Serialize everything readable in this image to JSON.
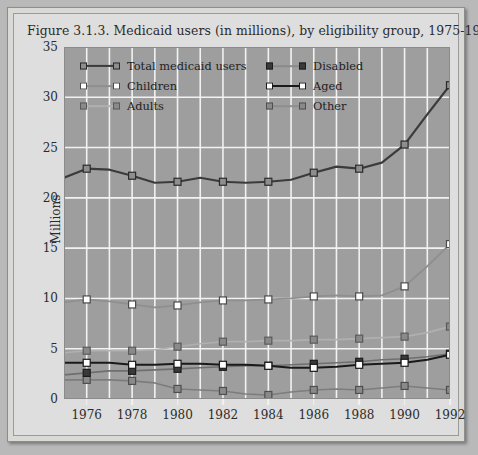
{
  "figure": {
    "title": "Figure 3.1.3. Medicaid users (in millions), by eligibility group, 1975-1992."
  },
  "chart_data": {
    "type": "line",
    "title": "Figure 3.1.3. Medicaid users (in millions), by eligibility group, 1975-1992.",
    "xlabel": "",
    "ylabel": "Millions",
    "ylim": [
      0,
      35
    ],
    "ytick_labels": [
      "0",
      "5",
      "10",
      "15",
      "20",
      "25",
      "30",
      "35"
    ],
    "yticks": [
      0,
      5,
      10,
      15,
      20,
      25,
      30,
      35
    ],
    "xlim": [
      1975,
      1992
    ],
    "x": [
      1975,
      1976,
      1977,
      1978,
      1979,
      1980,
      1981,
      1982,
      1983,
      1984,
      1985,
      1986,
      1987,
      1988,
      1989,
      1990,
      1991,
      1992
    ],
    "xtick_labels": [
      "1976",
      "1978",
      "1980",
      "1982",
      "1984",
      "1986",
      "1988",
      "1990",
      "1992"
    ],
    "xticks": [
      1976,
      1978,
      1980,
      1982,
      1984,
      1986,
      1988,
      1990,
      1992
    ],
    "grid": true,
    "legend_position": "upper-left-inside",
    "plot_bgcolor": "#9e9e9e",
    "grid_color": "#f2f2f2",
    "series": [
      {
        "name": "Total medicaid users",
        "color": "#3b3b3b",
        "marker_fill": "#8e8e8e",
        "marker_edge": "#2a2a2a",
        "line_width": 2.2,
        "values": [
          22.0,
          22.9,
          22.8,
          22.2,
          21.5,
          21.6,
          22.0,
          21.6,
          21.5,
          21.6,
          21.8,
          22.5,
          23.1,
          22.9,
          23.5,
          25.3,
          28.3,
          31.2
        ]
      },
      {
        "name": "Disabled",
        "color": "#6f6f6f",
        "marker_fill": "#3a3a3a",
        "marker_edge": "#1c1c1c",
        "line_width": 1.6,
        "values": [
          2.4,
          2.6,
          2.8,
          2.8,
          2.9,
          3.0,
          3.1,
          3.2,
          3.3,
          3.3,
          3.4,
          3.5,
          3.6,
          3.7,
          3.9,
          4.0,
          4.2,
          4.5
        ]
      },
      {
        "name": "Children",
        "color": "#8f8f8f",
        "marker_fill": "#ffffff",
        "marker_edge": "#4a4a4a",
        "line_width": 1.8,
        "values": [
          9.6,
          9.9,
          9.7,
          9.4,
          9.1,
          9.3,
          9.6,
          9.8,
          9.8,
          9.9,
          10.0,
          10.2,
          10.3,
          10.2,
          10.3,
          11.2,
          13.2,
          15.4
        ]
      },
      {
        "name": "Aged",
        "color": "#1a1a1a",
        "marker_fill": "#ffffff",
        "marker_edge": "#1a1a1a",
        "line_width": 2.0,
        "values": [
          3.6,
          3.6,
          3.6,
          3.4,
          3.4,
          3.5,
          3.5,
          3.4,
          3.4,
          3.3,
          3.1,
          3.1,
          3.2,
          3.4,
          3.5,
          3.6,
          3.9,
          4.4
        ]
      },
      {
        "name": "Adults",
        "color": "#b0b0b0",
        "marker_fill": "#8a8a8a",
        "marker_edge": "#5a5a5a",
        "line_width": 1.6,
        "values": [
          4.6,
          4.8,
          4.8,
          4.8,
          4.9,
          5.2,
          5.5,
          5.7,
          5.7,
          5.8,
          5.8,
          5.9,
          5.9,
          6.0,
          6.1,
          6.2,
          6.6,
          7.2
        ]
      },
      {
        "name": "Other",
        "color": "#7d7d7d",
        "marker_fill": "#8a8a8a",
        "marker_edge": "#4e4e4e",
        "line_width": 1.6,
        "values": [
          1.9,
          1.9,
          1.9,
          1.8,
          1.6,
          1.0,
          0.9,
          0.8,
          0.5,
          0.4,
          0.7,
          0.9,
          1.0,
          0.9,
          1.1,
          1.3,
          1.1,
          0.9
        ]
      }
    ]
  },
  "legend": {
    "rows": [
      [
        {
          "name": "Total medicaid users",
          "line": "#3b3b3b",
          "fill": "#8e8e8e",
          "edge": "#2a2a2a",
          "lw": 2.2
        },
        {
          "name": "Disabled",
          "line": "#8a8a8a",
          "fill": "#3a3a3a",
          "edge": "#1c1c1c",
          "lw": 1.6
        }
      ],
      [
        {
          "name": "Children",
          "line": "#8f8f8f",
          "fill": "#ffffff",
          "edge": "#4a4a4a",
          "lw": 1.8
        },
        {
          "name": "Aged",
          "line": "#1a1a1a",
          "fill": "#ffffff",
          "edge": "#1a1a1a",
          "lw": 2.0
        }
      ],
      [
        {
          "name": "Adults",
          "line": "#b0b0b0",
          "fill": "#8a8a8a",
          "edge": "#5a5a5a",
          "lw": 1.6
        },
        {
          "name": "Other",
          "line": "#8e8e8e",
          "fill": "#8a8a8a",
          "edge": "#4e4e4e",
          "lw": 1.6
        }
      ]
    ]
  }
}
